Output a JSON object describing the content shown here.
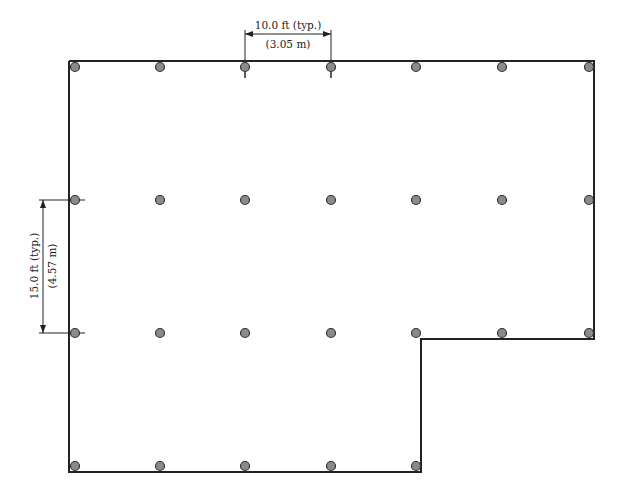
{
  "diagram": {
    "colors": {
      "wall": "#222222",
      "column_fill": "#8a8a8a",
      "column_stroke": "#333333",
      "dimension": "#222222",
      "background": "#ffffff"
    },
    "dimensions": {
      "horizontal": {
        "line1": "10.0 ft (typ.)",
        "line2": "(3.05 m)"
      },
      "vertical": {
        "line1": "15.0 ft (typ.)",
        "line2": "(4.57 m)"
      }
    },
    "grid": {
      "columns_x": [
        75,
        160,
        245,
        331,
        416,
        502,
        589
      ],
      "rows_y": [
        67,
        200,
        333,
        466
      ],
      "column_count_per_row": [
        7,
        7,
        7,
        5
      ]
    }
  }
}
